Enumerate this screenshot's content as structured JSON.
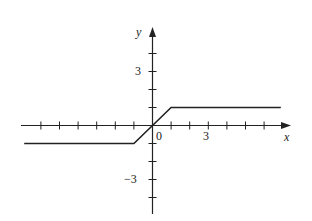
{
  "chart_data": {
    "type": "line",
    "title": "",
    "xlabel": "x",
    "ylabel": "y",
    "x_tick_labels": [
      "0",
      "3"
    ],
    "y_tick_labels": [
      "3",
      "-3"
    ],
    "xlim": [
      -7,
      7
    ],
    "ylim": [
      -5,
      5
    ],
    "x_ticks": [
      -6,
      -5,
      -4,
      -3,
      -2,
      -1,
      1,
      2,
      3,
      4,
      5,
      6
    ],
    "y_ticks": [
      -4,
      -3,
      -2,
      -1,
      1,
      2,
      3,
      4
    ],
    "grid": false,
    "series": [
      {
        "name": "f(x)",
        "x": [
          -6.9,
          -1,
          1,
          6.9
        ],
        "y": [
          -1,
          -1,
          1,
          1
        ]
      }
    ]
  },
  "labels": {
    "x_axis": "x",
    "y_axis": "y",
    "origin": "0",
    "x_three": "3",
    "y_three": "3",
    "y_neg_three": "−3"
  }
}
